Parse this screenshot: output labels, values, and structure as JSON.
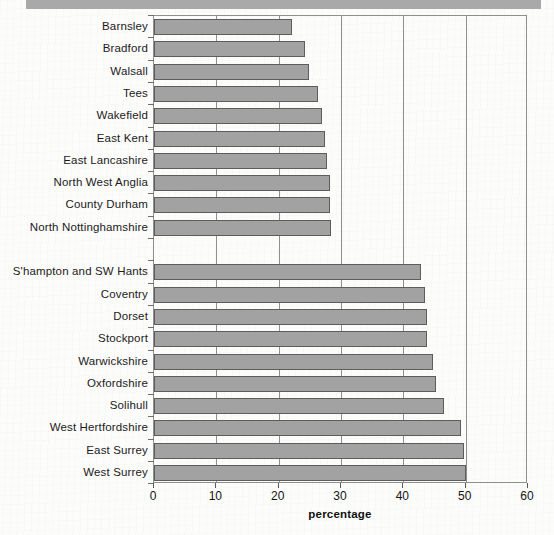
{
  "chart_data": {
    "type": "bar",
    "orientation": "horizontal",
    "title": "",
    "xlabel": "percentage",
    "ylabel": "",
    "xlim": [
      0,
      60
    ],
    "xticks": [
      0,
      10,
      20,
      30,
      40,
      50,
      60
    ],
    "xtick_labels": [
      "0",
      "10",
      "20",
      "30",
      "40",
      "50",
      "60"
    ],
    "grid": "vertical",
    "legend": "none",
    "bar_color": "#a2a2a2",
    "bar_edge_color": "#5d5d5d",
    "frame_color": "#8f8f8f",
    "groups": [
      {
        "name": "lowest",
        "categories": [
          "Barnsley",
          "Bradford",
          "Walsall",
          "Tees",
          "Wakefield",
          "East Kent",
          "East Lancashire",
          "North West Anglia",
          "County Durham",
          "North Nottinghamshire"
        ],
        "values": [
          22.1,
          24.2,
          24.9,
          26.3,
          27.0,
          27.5,
          27.8,
          28.3,
          28.3,
          28.4
        ]
      },
      {
        "name": "highest",
        "categories": [
          "S'hampton and SW Hants",
          "Coventry",
          "Dorset",
          "Stockport",
          "Warwickshire",
          "Oxfordshire",
          "Solihull",
          "West Hertfordshire",
          "East Surrey",
          "West Surrey"
        ],
        "values": [
          42.8,
          43.4,
          43.8,
          43.8,
          44.7,
          45.2,
          46.6,
          49.3,
          49.7,
          50.0
        ]
      }
    ]
  }
}
